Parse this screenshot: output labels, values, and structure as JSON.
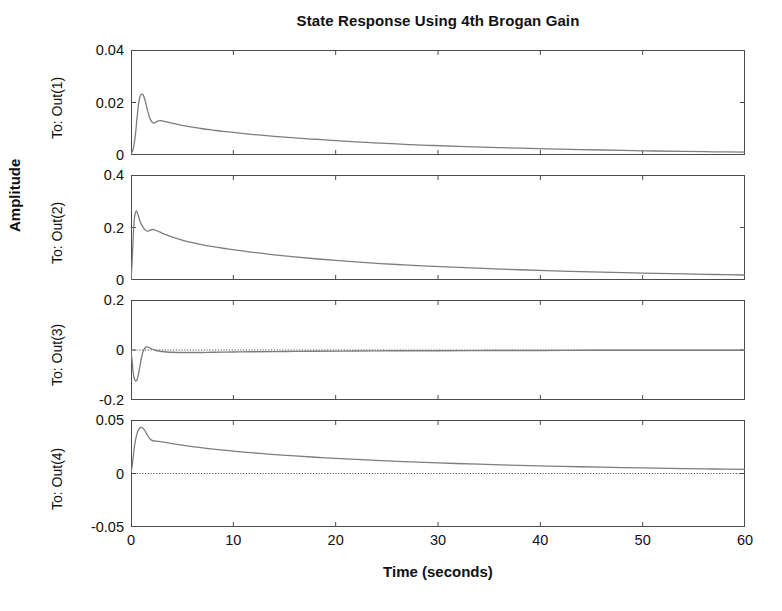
{
  "chart_data": {
    "type": "line",
    "title": "State Response Using 4th Brogan Gain",
    "xlabel": "Time (seconds)",
    "ylabel": "Amplitude",
    "grid": false,
    "legend": "none",
    "xlim": [
      0,
      60
    ],
    "xticks": [
      0,
      10,
      20,
      30,
      40,
      50,
      60
    ],
    "xticklabels": [
      "0",
      "10",
      "20",
      "30",
      "40",
      "50",
      "60"
    ],
    "subplots": [
      {
        "row_label": "To: Out(1)",
        "ylim": [
          0,
          0.04
        ],
        "yticks": [
          0,
          0.02,
          0.04
        ],
        "yticklabels": [
          "0",
          "0.02",
          "0.04"
        ],
        "zero_line": 0,
        "x": [
          0,
          0.15,
          0.3,
          0.45,
          0.6,
          0.75,
          0.9,
          1.05,
          1.2,
          1.4,
          1.6,
          1.8,
          2.0,
          2.2,
          2.4,
          2.6,
          2.8,
          3.0,
          3.5,
          4,
          5,
          6,
          7,
          8,
          9,
          10,
          12,
          14,
          16,
          18,
          20,
          23,
          26,
          29,
          32,
          35,
          38,
          42,
          46,
          50,
          54,
          57,
          60
        ],
        "y": [
          0.0005,
          0.0015,
          0.004,
          0.0085,
          0.0145,
          0.0198,
          0.0225,
          0.0232,
          0.0228,
          0.0205,
          0.0172,
          0.0145,
          0.0128,
          0.0122,
          0.0124,
          0.0129,
          0.0131,
          0.013,
          0.0126,
          0.0121,
          0.0113,
          0.0106,
          0.01,
          0.0095,
          0.009,
          0.0086,
          0.0078,
          0.0071,
          0.0065,
          0.006,
          0.0055,
          0.0048,
          0.0042,
          0.0037,
          0.0033,
          0.0029,
          0.0026,
          0.0022,
          0.0019,
          0.0016,
          0.0014,
          0.0012,
          0.0011
        ]
      },
      {
        "row_label": "To: Out(2)",
        "ylim": [
          0,
          0.4
        ],
        "yticks": [
          0,
          0.2,
          0.4
        ],
        "yticklabels": [
          "0",
          "0.2",
          "0.4"
        ],
        "zero_line": 0,
        "x": [
          0,
          0.1,
          0.2,
          0.3,
          0.4,
          0.5,
          0.6,
          0.75,
          0.9,
          1.05,
          1.2,
          1.4,
          1.6,
          1.8,
          2.0,
          2.2,
          2.5,
          2.8,
          3.2,
          3.6,
          4,
          5,
          6,
          7,
          8,
          9,
          10,
          12,
          14,
          16,
          18,
          20,
          23,
          26,
          29,
          32,
          35,
          38,
          42,
          46,
          50,
          54,
          57,
          60
        ],
        "y": [
          0.002,
          0.06,
          0.15,
          0.222,
          0.252,
          0.262,
          0.258,
          0.24,
          0.222,
          0.21,
          0.2,
          0.19,
          0.186,
          0.188,
          0.192,
          0.192,
          0.188,
          0.183,
          0.176,
          0.17,
          0.164,
          0.152,
          0.142,
          0.134,
          0.127,
          0.121,
          0.116,
          0.105,
          0.096,
          0.088,
          0.081,
          0.075,
          0.066,
          0.059,
          0.053,
          0.048,
          0.043,
          0.039,
          0.034,
          0.03,
          0.026,
          0.023,
          0.021,
          0.019
        ]
      },
      {
        "row_label": "To: Out(3)",
        "ylim": [
          -0.2,
          0.2
        ],
        "yticks": [
          -0.2,
          0,
          0.2
        ],
        "yticklabels": [
          "-0.2",
          "0",
          "0.2"
        ],
        "zero_line": 0,
        "x": [
          0,
          0.1,
          0.2,
          0.3,
          0.45,
          0.6,
          0.75,
          0.9,
          1.05,
          1.2,
          1.35,
          1.5,
          1.7,
          1.9,
          2.1,
          2.4,
          2.7,
          3.0,
          3.5,
          4,
          5,
          6,
          7,
          8,
          10,
          12,
          15,
          18,
          22,
          26,
          30,
          35,
          40,
          45,
          50,
          55,
          60
        ],
        "y": [
          -0.004,
          -0.04,
          -0.085,
          -0.112,
          -0.124,
          -0.118,
          -0.092,
          -0.058,
          -0.026,
          -0.004,
          0.008,
          0.012,
          0.011,
          0.007,
          0.003,
          -0.001,
          -0.004,
          -0.006,
          -0.008,
          -0.009,
          -0.01,
          -0.01,
          -0.01,
          -0.009,
          -0.008,
          -0.007,
          -0.006,
          -0.005,
          -0.004,
          -0.003,
          -0.003,
          -0.002,
          -0.002,
          -0.001,
          -0.001,
          -0.001,
          -0.001
        ]
      },
      {
        "row_label": "To: Out(4)",
        "ylim": [
          -0.05,
          0.05
        ],
        "yticks": [
          -0.05,
          0,
          0.05
        ],
        "yticklabels": [
          "-0.05",
          "0",
          "0.05"
        ],
        "zero_line": 0,
        "x": [
          0,
          0.1,
          0.2,
          0.35,
          0.5,
          0.65,
          0.8,
          0.95,
          1.1,
          1.25,
          1.4,
          1.6,
          1.8,
          2.0,
          2.2,
          2.4,
          2.7,
          3.0,
          3.5,
          4,
          5,
          6,
          7,
          8,
          9,
          10,
          12,
          14,
          16,
          18,
          20,
          23,
          26,
          30,
          34,
          38,
          42,
          46,
          50,
          54,
          57,
          60
        ],
        "y": [
          0.0015,
          0.006,
          0.014,
          0.026,
          0.034,
          0.039,
          0.042,
          0.0432,
          0.0428,
          0.0415,
          0.0395,
          0.036,
          0.033,
          0.0312,
          0.0305,
          0.0303,
          0.03,
          0.0296,
          0.0288,
          0.028,
          0.0265,
          0.0251,
          0.0239,
          0.0228,
          0.0218,
          0.0209,
          0.0192,
          0.0177,
          0.0164,
          0.0152,
          0.0141,
          0.0127,
          0.0114,
          0.0099,
          0.0087,
          0.0076,
          0.0067,
          0.0059,
          0.0052,
          0.0046,
          0.0042,
          0.0038
        ]
      }
    ]
  },
  "style": {
    "line_color": "#7d7d7d",
    "axis_color": "#4a4a4a",
    "text_color": "#111111",
    "background": "#ffffff"
  }
}
